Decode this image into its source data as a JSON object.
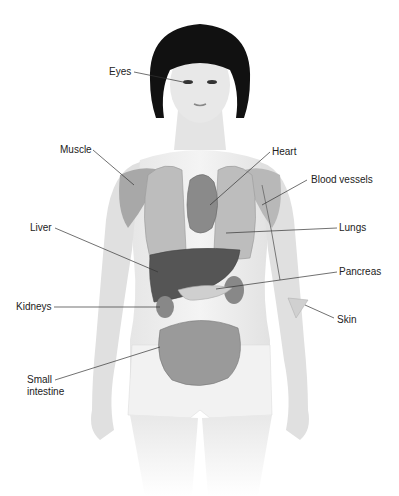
{
  "diagram": {
    "labels": [
      {
        "id": "eyes",
        "text": "Eyes"
      },
      {
        "id": "muscle",
        "text": "Muscle"
      },
      {
        "id": "heart",
        "text": "Heart"
      },
      {
        "id": "blood_vessels",
        "text": "Blood vessels"
      },
      {
        "id": "lungs",
        "text": "Lungs"
      },
      {
        "id": "liver",
        "text": "Liver"
      },
      {
        "id": "pancreas",
        "text": "Pancreas"
      },
      {
        "id": "kidneys",
        "text": "Kidneys"
      },
      {
        "id": "skin",
        "text": "Skin"
      },
      {
        "id": "small_intestine",
        "text": "Small intestine"
      }
    ]
  }
}
